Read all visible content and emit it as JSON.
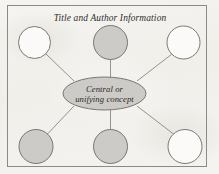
{
  "figure": {
    "title": "Title and Author Information",
    "background_color": "#f4f2ef",
    "frame_color": "#8d8a85",
    "node_fill_color": "#cdcbc7",
    "node_hollow_color": "#fbfaf8",
    "node_stroke_color": "#6e6b66",
    "connector_color": "#8a8782"
  },
  "center_node": {
    "label_line1": "Central or",
    "label_line2": "unifying concept",
    "shape": "ellipse",
    "fill": "shaded",
    "cx": 104.5,
    "cy": 93.5,
    "rx": 41.5,
    "ry": 16.5
  },
  "satellite_nodes": [
    {
      "id": "top-left",
      "fill": "hollow",
      "cx": 34.5,
      "cy": 42.5,
      "r": 16.0
    },
    {
      "id": "top-center",
      "fill": "shaded",
      "cx": 110.5,
      "cy": 42.5,
      "r": 17.0
    },
    {
      "id": "top-right",
      "fill": "hollow",
      "cx": 183.5,
      "cy": 42.5,
      "r": 16.5
    },
    {
      "id": "bottom-left",
      "fill": "shaded",
      "cx": 36.0,
      "cy": 146.5,
      "r": 17.0
    },
    {
      "id": "bottom-center",
      "fill": "shaded",
      "cx": 110.5,
      "cy": 146.5,
      "r": 17.0
    },
    {
      "id": "bottom-right",
      "fill": "hollow",
      "cx": 185.0,
      "cy": 146.5,
      "r": 17.0
    }
  ],
  "connectors": [
    {
      "from": "center",
      "to": "top-left",
      "x1": 74.0,
      "y1": 81.0,
      "x2": 46.0,
      "y2": 54.0
    },
    {
      "from": "center",
      "to": "top-center",
      "x1": 110.5,
      "y1": 77.0,
      "x2": 110.5,
      "y2": 59.5
    },
    {
      "from": "center",
      "to": "top-right",
      "x1": 137.0,
      "y1": 81.0,
      "x2": 172.0,
      "y2": 54.0
    },
    {
      "from": "center",
      "to": "bottom-left",
      "x1": 74.0,
      "y1": 106.0,
      "x2": 47.5,
      "y2": 134.0
    },
    {
      "from": "center",
      "to": "bottom-center",
      "x1": 110.5,
      "y1": 110.0,
      "x2": 110.5,
      "y2": 129.5
    },
    {
      "from": "center",
      "to": "bottom-right",
      "x1": 137.0,
      "y1": 106.0,
      "x2": 173.5,
      "y2": 134.0
    }
  ],
  "frame": {
    "x": 7.5,
    "y": 5.5,
    "width": 199,
    "height": 161
  }
}
